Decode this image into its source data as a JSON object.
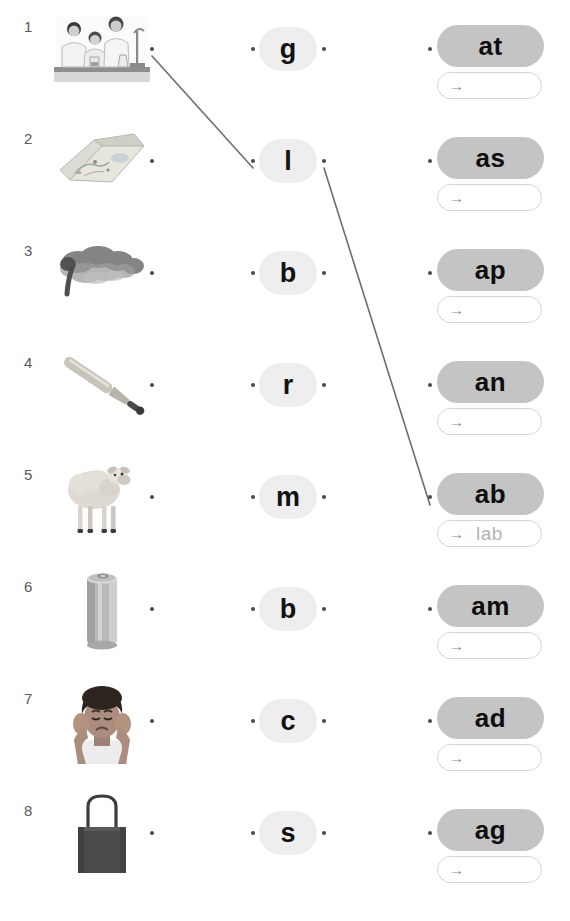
{
  "worksheet": {
    "title": "Phonics word-family matching worksheet",
    "row_count": 8,
    "colors": {
      "word_pill_fill": "#c4c4c4",
      "letter_pill_fill": "#eeeeee",
      "answer_box_border": "#d4d4d4",
      "answer_text": "#b4b4b4",
      "connector_line": "#6e6e6e",
      "dot": "#4a4a4a",
      "row_number": "#58595b"
    },
    "arrow_glyph": "→"
  },
  "rows": [
    {
      "number": "1",
      "picture_name": "science-lab-students-image",
      "picture_alt": "students working in a science laboratory",
      "letter": "g",
      "word_ending": "at",
      "answer": "",
      "answer_arrow": "→"
    },
    {
      "number": "2",
      "picture_name": "map-image",
      "picture_alt": "an open folded paper map",
      "letter": "l",
      "word_ending": "as",
      "answer": "",
      "answer_arrow": "→"
    },
    {
      "number": "3",
      "picture_name": "smoke-gas-cloud-image",
      "picture_alt": "a dark cloud of smoke or gas",
      "letter": "b",
      "word_ending": "ap",
      "answer": "",
      "answer_arrow": "→"
    },
    {
      "number": "4",
      "picture_name": "baseball-bat-image",
      "picture_alt": "a baseball bat",
      "letter": "r",
      "word_ending": "an",
      "answer": "",
      "answer_arrow": "→"
    },
    {
      "number": "5",
      "picture_name": "lamb-sheep-image",
      "picture_alt": "a lamb standing",
      "letter": "m",
      "word_ending": "ab",
      "answer": "lab",
      "answer_arrow": "→"
    },
    {
      "number": "6",
      "picture_name": "aluminium-can-image",
      "picture_alt": "a silver aluminium drink can",
      "letter": "b",
      "word_ending": "am",
      "answer": "",
      "answer_arrow": "→"
    },
    {
      "number": "7",
      "picture_name": "sad-child-covering-ears-image",
      "picture_alt": "a sad child covering their ears",
      "letter": "c",
      "word_ending": "ad",
      "answer": "",
      "answer_arrow": "→"
    },
    {
      "number": "8",
      "picture_name": "tote-bag-image",
      "picture_alt": "a dark tote bag with handles",
      "letter": "s",
      "word_ending": "ag",
      "answer": "",
      "answer_arrow": "→"
    }
  ],
  "connections": [
    {
      "name": "connector-picture1-to-letter-l",
      "from": "row-1-picture-dot",
      "to": "row-2-letter-left-dot",
      "x1": 152,
      "y1": 56,
      "x2": 253,
      "y2": 168
    },
    {
      "name": "connector-letter-l-to-word-ab",
      "from": "row-2-letter-right-dot",
      "to": "row-5-word-dot",
      "x1": 324,
      "y1": 168,
      "x2": 430,
      "y2": 505
    }
  ]
}
